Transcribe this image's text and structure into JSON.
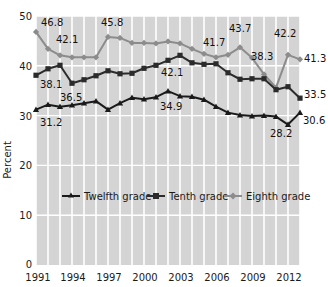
{
  "chart_data": {
    "type": "line",
    "title": "",
    "subtitle": "",
    "xlabel": "",
    "ylabel": "Percent",
    "ylim": [
      0,
      50
    ],
    "xlim": [
      1991,
      2013
    ],
    "grid": true,
    "grid_color": "#ffffff",
    "plot_background": "#d4d4d4",
    "legend_position": "inside-middle",
    "yticks": [
      "0",
      "10",
      "20",
      "30",
      "40",
      "50"
    ],
    "ytick_values": [
      0,
      10,
      20,
      30,
      40,
      50
    ],
    "xticks": [
      "1991",
      "1994",
      "1997",
      "2000",
      "2003",
      "2006",
      "2009",
      "2012"
    ],
    "xtick_values": [
      1991,
      1994,
      1997,
      2000,
      2003,
      2006,
      2009,
      2012
    ],
    "x": [
      1991,
      1992,
      1993,
      1994,
      1995,
      1996,
      1997,
      1998,
      1999,
      2000,
      2001,
      2002,
      2003,
      2004,
      2005,
      2006,
      2007,
      2008,
      2009,
      2010,
      2011,
      2012,
      2013
    ],
    "series": [
      {
        "name": "Twelfth grade",
        "color": "#8c8c8c",
        "marker": "diamond",
        "values": [
          46.8,
          43.4,
          42.1,
          41.7,
          41.7,
          41.7,
          45.8,
          45.6,
          44.6,
          44.6,
          44.5,
          44.9,
          44.5,
          43.4,
          42.4,
          41.7,
          42.2,
          43.7,
          41.6,
          38.3,
          35.6,
          42.2,
          41.3
        ]
      },
      {
        "name": "Tenth grade",
        "color": "#2b2b2b",
        "marker": "square",
        "values": [
          38.1,
          39.4,
          40.1,
          36.5,
          37.2,
          38.0,
          39.0,
          38.4,
          38.5,
          39.5,
          40.1,
          41.1,
          42.1,
          40.6,
          40.3,
          40.4,
          38.6,
          37.3,
          37.4,
          37.4,
          35.2,
          35.8,
          33.5
        ]
      },
      {
        "name": "Eighth grade",
        "color": "#1a1a1a",
        "marker": "triangle",
        "values": [
          31.2,
          32.2,
          31.8,
          32.1,
          32.5,
          32.9,
          31.2,
          32.5,
          33.6,
          33.3,
          33.7,
          34.9,
          33.9,
          33.8,
          33.2,
          31.8,
          30.6,
          30.1,
          29.9,
          30.0,
          29.8,
          28.2,
          30.6
        ]
      }
    ],
    "point_labels": [
      {
        "series": "Twelfth grade",
        "x": 1991,
        "value": "46.8"
      },
      {
        "series": "Twelfth grade",
        "x": 1993,
        "value": "42.1"
      },
      {
        "series": "Twelfth grade",
        "x": 1997,
        "value": "45.8"
      },
      {
        "series": "Twelfth grade",
        "x": 2006,
        "value": "41.7"
      },
      {
        "series": "Twelfth grade",
        "x": 2008,
        "value": "43.7"
      },
      {
        "series": "Twelfth grade",
        "x": 2010,
        "value": "38.3"
      },
      {
        "series": "Twelfth grade",
        "x": 2012,
        "value": "42.2"
      },
      {
        "series": "Twelfth grade",
        "x": 2013,
        "value": "41.3"
      },
      {
        "series": "Tenth grade",
        "x": 1991,
        "value": "38.1"
      },
      {
        "series": "Tenth grade",
        "x": 1994,
        "value": "36.5"
      },
      {
        "series": "Tenth grade",
        "x": 2003,
        "value": "42.1"
      },
      {
        "series": "Tenth grade",
        "x": 2013,
        "value": "33.5"
      },
      {
        "series": "Eighth grade",
        "x": 1991,
        "value": "31.2"
      },
      {
        "series": "Eighth grade",
        "x": 2002,
        "value": "34.9"
      },
      {
        "series": "Eighth grade",
        "x": 2012,
        "value": "28.2"
      },
      {
        "series": "Eighth grade",
        "x": 2013,
        "value": "30.6"
      }
    ]
  },
  "axis": {
    "ylabel": "Percent",
    "ytick_0": "0",
    "ytick_10": "10",
    "ytick_20": "20",
    "ytick_30": "30",
    "ytick_40": "40",
    "ytick_50": "50",
    "xtick_1991": "1991",
    "xtick_1994": "1994",
    "xtick_1997": "1997",
    "xtick_2000": "2000",
    "xtick_2003": "2003",
    "xtick_2006": "2006",
    "xtick_2009": "2009",
    "xtick_2012": "2012"
  },
  "legend": {
    "items": [
      {
        "label": "Twelfth grade",
        "color": "#1a1a1a",
        "marker": "triangle"
      },
      {
        "label": "Tenth grade",
        "color": "#2b2b2b",
        "marker": "square"
      },
      {
        "label": "Eighth grade",
        "color": "#8c8c8c",
        "marker": "diamond"
      }
    ]
  },
  "labels": {
    "l_468": "46.8",
    "l_421_top": "42.1",
    "l_458": "45.8",
    "l_417": "41.7",
    "l_437": "43.7",
    "l_383": "38.3",
    "l_422": "42.2",
    "l_413": "41.3",
    "l_381": "38.1",
    "l_365": "36.5",
    "l_421_mid": "42.1",
    "l_335": "33.5",
    "l_312": "31.2",
    "l_349": "34.9",
    "l_282": "28.2",
    "l_306": "30.6"
  }
}
